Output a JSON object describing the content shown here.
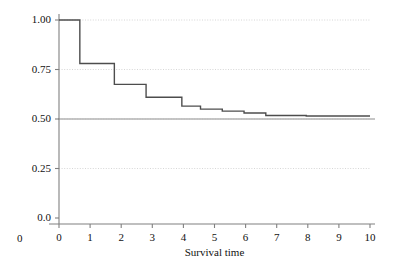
{
  "chart_data": {
    "type": "line",
    "subtype": "step-post",
    "title": "",
    "xlabel": "Survival time",
    "ylabel": "",
    "xlim": [
      0,
      10
    ],
    "ylim": [
      0,
      1.0
    ],
    "xticks": [
      0,
      1,
      2,
      3,
      4,
      5,
      6,
      7,
      8,
      9,
      10
    ],
    "xtick_labels": [
      "0",
      "1",
      "2",
      "3",
      "4",
      "5",
      "6",
      "7",
      "8",
      "9",
      "10"
    ],
    "yticks": [
      0.0,
      0.25,
      0.5,
      0.75,
      1.0
    ],
    "ytick_labels": [
      "0.0",
      "0.25",
      "0.50",
      "0.75",
      "1.00"
    ],
    "origin_corner_label": "0",
    "grid": "horizontal-dotted",
    "grid_color": "#cccccc",
    "legend": null,
    "series": [
      {
        "name": "survival",
        "color": "#4d4d4d",
        "linewidth": 1.4,
        "x": [
          0.0,
          0.67,
          1.78,
          2.8,
          3.95,
          4.55,
          5.25,
          5.95,
          6.65,
          7.95,
          10.0
        ],
        "y": [
          1.0,
          0.78,
          0.675,
          0.61,
          0.565,
          0.55,
          0.54,
          0.53,
          0.518,
          0.515,
          0.515
        ]
      }
    ],
    "reference_lines": [
      {
        "name": "median-survival-line",
        "orientation": "horizontal",
        "value": 0.5,
        "color": "#b3b3b3",
        "style": "solid"
      }
    ]
  },
  "axes": {
    "x_axis_color": "#808080",
    "y_axis_color": "#808080",
    "tick_color": "#808080"
  }
}
